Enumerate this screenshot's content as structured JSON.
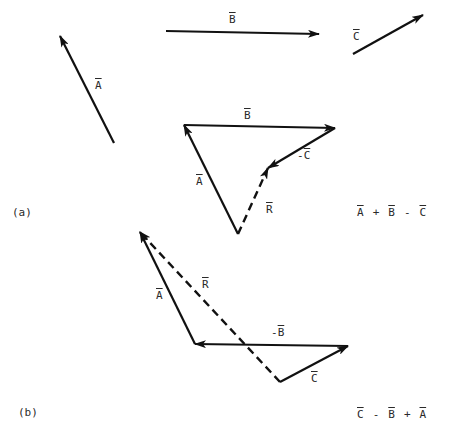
{
  "colors": {
    "ink": "#111111",
    "text": "#2a2a2a",
    "background": "#ffffff"
  },
  "standalone_vectors": {
    "A": {
      "label": "A",
      "tail": [
        114,
        143
      ],
      "head": [
        60,
        36
      ],
      "label_pos": [
        95,
        80
      ]
    },
    "B": {
      "label": "B",
      "tail": [
        166,
        31
      ],
      "head": [
        319,
        34
      ],
      "label_pos": [
        229,
        14
      ]
    },
    "C": {
      "label": "C",
      "tail": [
        353,
        54
      ],
      "head": [
        423,
        15
      ],
      "label_pos": [
        353,
        31
      ]
    }
  },
  "part_a": {
    "tag": "(a)",
    "expression": [
      "A",
      "+",
      "B",
      "-",
      "C"
    ],
    "vectors": [
      {
        "name": "A",
        "label": "A",
        "tail": [
          238,
          234
        ],
        "head": [
          184,
          125
        ],
        "dashed": false
      },
      {
        "name": "B",
        "label": "B",
        "tail": [
          184,
          125
        ],
        "head": [
          335,
          128
        ],
        "dashed": false
      },
      {
        "name": "neg-C",
        "label": "C",
        "prefix": "-",
        "tail": [
          335,
          128
        ],
        "head": [
          268,
          168
        ],
        "dashed": false
      },
      {
        "name": "R",
        "label": "R",
        "tail": [
          238,
          234
        ],
        "head": [
          268,
          168
        ],
        "dashed": true
      }
    ]
  },
  "part_b": {
    "tag": "(b)",
    "expression": [
      "C",
      "-",
      "B",
      "+",
      "A"
    ],
    "vectors": [
      {
        "name": "C",
        "label": "C",
        "tail": [
          280,
          382
        ],
        "head": [
          348,
          346
        ],
        "dashed": false
      },
      {
        "name": "neg-B",
        "label": "B",
        "prefix": "-",
        "tail": [
          348,
          346
        ],
        "head": [
          195,
          344
        ],
        "dashed": false
      },
      {
        "name": "A",
        "label": "A",
        "tail": [
          195,
          344
        ],
        "head": [
          140,
          232
        ],
        "dashed": false
      },
      {
        "name": "R",
        "label": "R",
        "tail": [
          280,
          382
        ],
        "head": [
          140,
          232
        ],
        "dashed": true
      }
    ]
  },
  "labels": {
    "sA": "A",
    "sB": "B",
    "sC": "C",
    "aB": "B",
    "aNegC_prefix": "-",
    "aNegC": "C",
    "aA": "A",
    "aR": "R",
    "a_tag": "(a)",
    "a_expr": {
      "t1": "A",
      "op1": "+",
      "t2": "B",
      "op2": "-",
      "t3": "C"
    },
    "bA": "A",
    "bR": "R",
    "bNegB_prefix": "-",
    "bNegB": "B",
    "bC": "C",
    "b_tag": "(b)",
    "b_expr": {
      "t1": "C",
      "op1": "-",
      "t2": "B",
      "op2": "+",
      "t3": "A"
    }
  }
}
